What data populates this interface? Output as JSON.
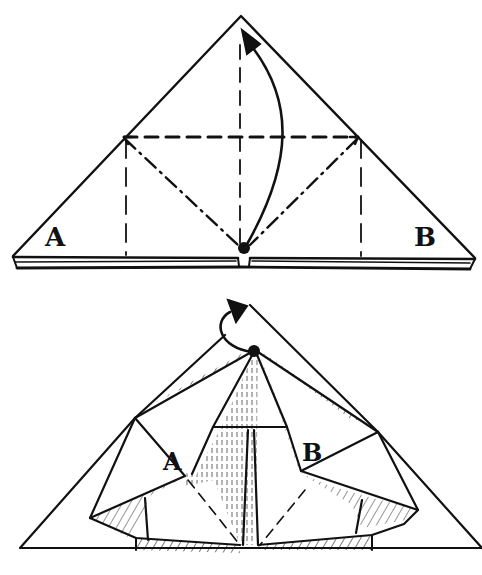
{
  "diagram": {
    "type": "origami-instructions",
    "steps": [
      {
        "name": "step-1-crease-pattern",
        "labels": {
          "left": "A",
          "right": "B"
        },
        "lines": {
          "outline": "solid",
          "horizontal_fold": "dashed valley fold",
          "vertical_center": "dashed",
          "vertical_side_left": "dashed",
          "vertical_side_right": "dashed",
          "diagonals": "dash-dot mountain folds"
        },
        "arrow": "curved arrow from bottom center dot to apex"
      },
      {
        "name": "step-2-squash-result",
        "labels": {
          "left": "A",
          "right": "B"
        },
        "arrow": "loop arrow from dot to top tip",
        "shading": "hatched underside regions"
      }
    ],
    "colors": {
      "ink": "#111111",
      "paper": "#ffffff"
    }
  }
}
